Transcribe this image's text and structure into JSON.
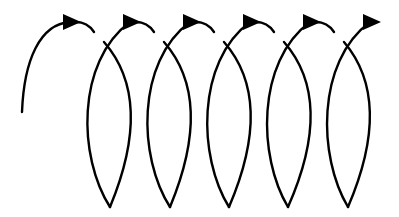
{
  "diagram": {
    "colors": {
      "stroke": "#000000",
      "background": "#ffffff"
    },
    "loop_count": 5,
    "arrow_count": 6,
    "loops": [
      {
        "left_x": 82,
        "right_x": 137,
        "bottom_x": 110
      },
      {
        "left_x": 142,
        "right_x": 197,
        "bottom_x": 170
      },
      {
        "left_x": 202,
        "right_x": 257,
        "bottom_x": 229
      },
      {
        "left_x": 262,
        "right_x": 317,
        "bottom_x": 288
      },
      {
        "left_x": 322,
        "right_x": 376,
        "bottom_x": 348
      }
    ],
    "arrow_direction": "right"
  }
}
